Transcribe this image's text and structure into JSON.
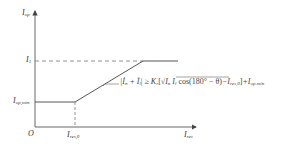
{
  "diagram": {
    "type": "restraint-characteristic",
    "colors": {
      "line": "#555555",
      "text": "#333333",
      "background": "#ffffff"
    },
    "axes": {
      "y_label_main": "I",
      "y_label_sub": "op",
      "x_label_main": "I",
      "x_label_sub": "res",
      "origin_label": "O"
    },
    "levels": {
      "i1_main": "I",
      "i1_sub": "1",
      "iopmin_main": "I",
      "iopmin_sub": "op,min",
      "ires0_main": "I",
      "ires0_sub": "res,0"
    },
    "formula": {
      "lhs": "|İ",
      "lhs_n": "n",
      "plus": " + İ",
      "lhs_l": "l",
      "bar": "|",
      "ge": " ≥ K",
      "k_sub": "r",
      "bracket_open": "[",
      "sqrt_sym": "√",
      "in": "I",
      "in_sub": "n",
      "il": " I",
      "il_sub": "l",
      "cos": " cos(180° − θ)",
      "minus": "−I",
      "ires_sub": "res,0",
      "bracket_close": "]",
      "plus_iop": "+I",
      "iop_sub": "op.min"
    }
  }
}
